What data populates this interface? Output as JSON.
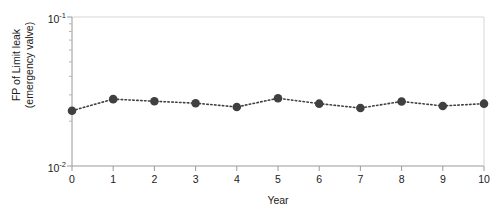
{
  "chart_data": {
    "type": "line",
    "title": "",
    "subtitle": "",
    "xlabel": "Year",
    "ylabel": "FP of Limit leak\n(emergency valve)",
    "ylabel_line1": "FP of Limit leak",
    "ylabel_line2": "(emergency valve)",
    "x": [
      0,
      1,
      2,
      3,
      4,
      5,
      6,
      7,
      8,
      9,
      10
    ],
    "values": [
      0.0235,
      0.0281,
      0.0272,
      0.0264,
      0.0249,
      0.0285,
      0.0262,
      0.0245,
      0.0271,
      0.0253,
      0.0262
    ],
    "series": [
      {
        "name": "FP of Limit leak (emergency valve)",
        "values": [
          0.0235,
          0.0281,
          0.0272,
          0.0264,
          0.0249,
          0.0285,
          0.0262,
          0.0245,
          0.0271,
          0.0253,
          0.0262
        ]
      }
    ],
    "xlim": [
      0,
      10
    ],
    "ylim": [
      0.01,
      0.1
    ],
    "yscale": "log",
    "xscale": "linear",
    "grid": false,
    "legend": false,
    "legend_position": "none",
    "marker": "circle",
    "linestyle": "dotted",
    "series_color": "#404040",
    "axis_color": "#9a9a9a",
    "text_color": "#1a1a1a",
    "xticks": [
      "0",
      "1",
      "2",
      "3",
      "4",
      "5",
      "6",
      "7",
      "8",
      "9",
      "10"
    ],
    "ytick_major": [
      {
        "label_mantissa": "10",
        "label_exponent": "-1",
        "value": 0.1
      },
      {
        "label_mantissa": "10",
        "label_exponent": "-2",
        "value": 0.01
      }
    ],
    "ytick_minor": [
      0.02,
      0.03,
      0.04,
      0.05,
      0.06,
      0.07,
      0.08,
      0.09
    ]
  }
}
